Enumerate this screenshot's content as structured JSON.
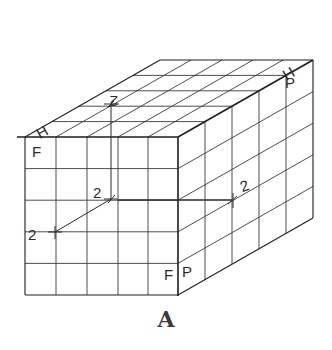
{
  "figure": {
    "caption": "A",
    "grid": {
      "front_columns": 5,
      "front_rows": 5,
      "depth_divisions": 5
    },
    "plane_labels": {
      "horizontal_front": "H",
      "horizontal_back": "H",
      "frontal_top": "F",
      "frontal_bottom": "F",
      "profile_top": "P",
      "profile_bottom": "P"
    },
    "dimension_labels": {
      "top_face": "2",
      "front_center": "2",
      "front_left": "2",
      "right_face": "2"
    },
    "colors": {
      "line": "#3a3a3a",
      "background": "#ffffff"
    }
  }
}
